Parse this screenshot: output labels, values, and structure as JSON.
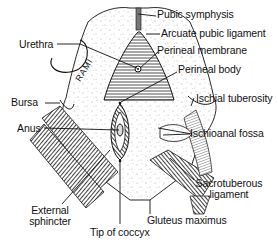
{
  "figure": {
    "type": "anatomical-line-drawing",
    "colors": {
      "ink": "#111111",
      "background": "#ffffff",
      "stipple": "#555555"
    }
  },
  "labels": {
    "pubic_symphysis": "Pubic symphysis",
    "arcuate_pubic_ligament": "Arcuate pubic ligament",
    "urethra": "Urethra",
    "perineal_membrane": "Perineal membrane",
    "rami": "RAMI",
    "perineal_body": "Perineal body",
    "bursa": "Bursa",
    "ischial_tuberosity": "Ischial tuberosity",
    "anus": "Anus",
    "ischioanal_fossa": "Ischioanal fossa",
    "sacrotuberous_ligament_line1": "Sacrotuberous",
    "sacrotuberous_ligament_line2": "ligament",
    "external_sphincter_line1": "External",
    "external_sphincter_line2": "sphincter",
    "gluteus_maximus": "Gluteus maximus",
    "tip_of_coccyx": "Tip of coccyx"
  }
}
